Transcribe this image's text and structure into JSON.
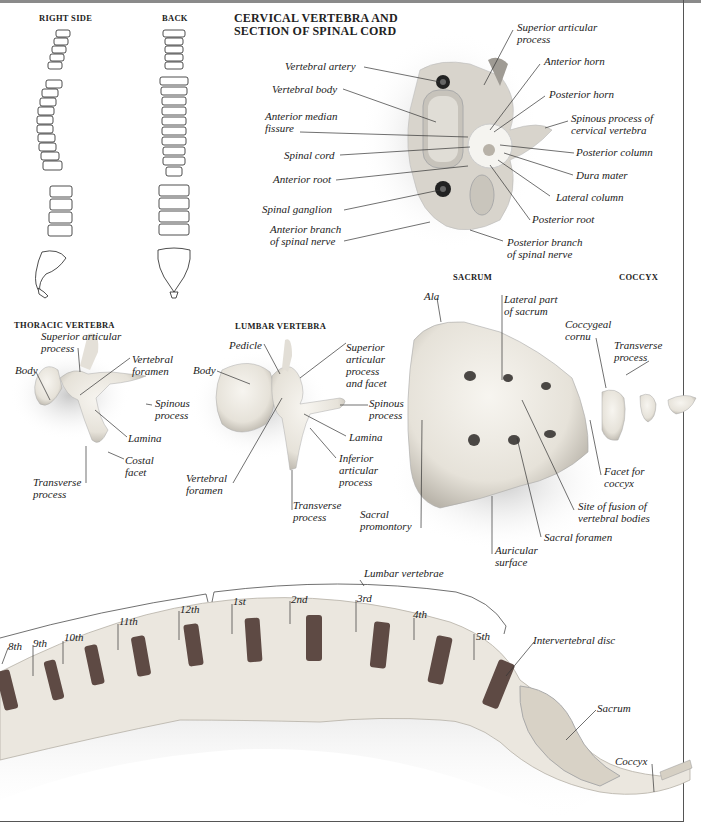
{
  "headings": {
    "right_side": "RIGHT SIDE",
    "back": "BACK",
    "cervical_l1": "CERVICAL VERTEBRA AND",
    "cervical_l2": "SECTION OF SPINAL CORD",
    "thoracic": "THORACIC VERTEBRA",
    "lumbar": "LUMBAR VERTEBRA",
    "sacrum": "SACRUM",
    "coccyx": "COCCYX"
  },
  "cervical_labels": {
    "vertebral_artery": "Vertebral artery",
    "vertebral_body": "Vertebral body",
    "anterior_median_l1": "Anterior median",
    "anterior_median_l2": "fissure",
    "spinal_cord": "Spinal cord",
    "anterior_root": "Anterior root",
    "spinal_ganglion": "Spinal ganglion",
    "anterior_branch_l1": "Anterior branch",
    "anterior_branch_l2": "of spinal nerve",
    "superior_articular_l1": "Superior articular",
    "superior_articular_l2": "process",
    "anterior_horn": "Anterior horn",
    "posterior_horn": "Posterior horn",
    "spinous_l1": "Spinous process of",
    "spinous_l2": "cervical vertebra",
    "posterior_column": "Posterior column",
    "dura_mater": "Dura mater",
    "lateral_column": "Lateral column",
    "posterior_root": "Posterior root",
    "posterior_branch_l1": "Posterior branch",
    "posterior_branch_l2": "of spinal nerve"
  },
  "thoracic_labels": {
    "superior_l1": "Superior articular",
    "superior_l2": "process",
    "body": "Body",
    "vertebral_foramen_l1": "Vertebral",
    "vertebral_foramen_l2": "foramen",
    "spinous_l1": "Spinous",
    "spinous_l2": "process",
    "lamina": "Lamina",
    "costal_l1": "Costal",
    "costal_l2": "facet",
    "transverse_l1": "Transverse",
    "transverse_l2": "process"
  },
  "lumbar_labels": {
    "pedicle": "Pedicle",
    "body": "Body",
    "superior_l1": "Superior",
    "superior_l2": "articular",
    "superior_l3": "process",
    "superior_l4": "and facet",
    "spinous_l1": "Spinous",
    "spinous_l2": "process",
    "lamina": "Lamina",
    "inferior_l1": "Inferior",
    "inferior_l2": "articular",
    "inferior_l3": "process",
    "vertebral_foramen_l1": "Vertebral",
    "vertebral_foramen_l2": "foramen",
    "transverse_l1": "Transverse",
    "transverse_l2": "process"
  },
  "sacrum_labels": {
    "ala": "Ala",
    "lateral_l1": "Lateral part",
    "lateral_l2": "of sacrum",
    "sacral_prom_l1": "Sacral",
    "sacral_prom_l2": "promontory",
    "auricular_l1": "Auricular",
    "auricular_l2": "surface",
    "sacral_foramen": "Sacral foramen",
    "fusion_l1": "Site of fusion of",
    "fusion_l2": "vertebral bodies",
    "facet_l1": "Facet for",
    "facet_l2": "coccyx"
  },
  "coccyx_labels": {
    "cornu_l1": "Coccygeal",
    "cornu_l2": "cornu",
    "transverse_l1": "Transverse",
    "transverse_l2": "process"
  },
  "lower_spine": {
    "lumbar_vertebrae": "Lumbar vertebrae",
    "thoracic_numbers": [
      "8th",
      "9th",
      "10th",
      "11th",
      "12th"
    ],
    "lumbar_numbers": [
      "1st",
      "2nd",
      "3rd",
      "4th",
      "5th"
    ],
    "intervertebral_disc": "Intervertebral disc",
    "sacrum": "Sacrum",
    "coccyx": "Coccyx"
  },
  "colors": {
    "bone": "#ece8e0",
    "bone_shadow": "#bdb8ae",
    "disc": "#5e4a44",
    "line": "#333333"
  }
}
